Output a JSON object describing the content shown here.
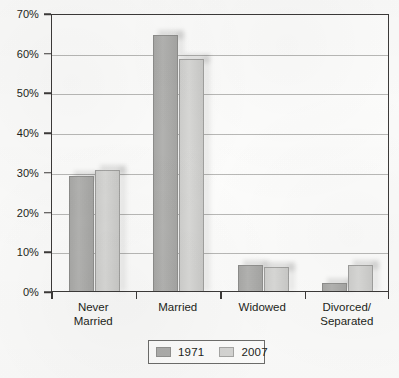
{
  "chart_data": {
    "type": "bar",
    "title": "",
    "subtitle": "",
    "xlabel": "",
    "ylabel": "",
    "categories": [
      "Never\nMarried",
      "Married",
      "Widowed",
      "Divorced/\nSeparated"
    ],
    "series": [
      {
        "name": "1971",
        "color": "#adadab",
        "values": [
          29,
          64.5,
          6.5,
          2
        ]
      },
      {
        "name": "2007",
        "color": "#d5d5d3",
        "values": [
          30.5,
          58.5,
          6,
          6.5
        ]
      }
    ],
    "ylim": [
      0,
      70
    ],
    "y_ticks": [
      0,
      10,
      20,
      30,
      40,
      50,
      60,
      70
    ],
    "y_tick_labels": [
      "0%",
      "10%",
      "20%",
      "30%",
      "40%",
      "50%",
      "60%",
      "70%"
    ],
    "grid": "horizontal",
    "legend_position": "bottom-center",
    "legend_entries": [
      "1971",
      "2007"
    ],
    "value_labels_shown": false
  }
}
